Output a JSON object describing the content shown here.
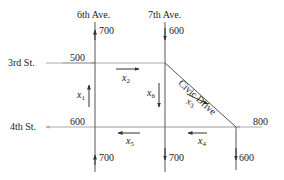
{
  "diagram": {
    "streets": {
      "avenue_left": "6th Ave.",
      "avenue_right": "7th Ave.",
      "street_top": "3rd St.",
      "street_bottom": "4th St.",
      "diagonal": "Civic Drive"
    },
    "external_flows": {
      "sixth_top": "700",
      "seventh_top": "600",
      "third_left": "500",
      "fourth_left": "600",
      "fourth_right": "800",
      "sixth_bottom": "700",
      "seventh_bottom": "700",
      "right_bottom": "600"
    },
    "variables": {
      "x1": {
        "name": "x",
        "sub": "1"
      },
      "x2": {
        "name": "x",
        "sub": "2"
      },
      "x3": {
        "name": "x",
        "sub": "3"
      },
      "x4": {
        "name": "x",
        "sub": "4"
      },
      "x5": {
        "name": "x",
        "sub": "5"
      },
      "x6": {
        "name": "x",
        "sub": "6"
      }
    },
    "colors": {
      "road": "#555555",
      "entry_road": "#aaaaaa",
      "arrow": "#333333"
    }
  }
}
